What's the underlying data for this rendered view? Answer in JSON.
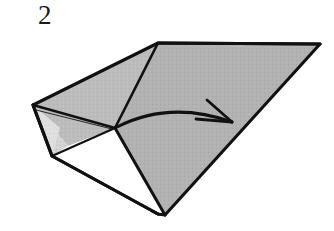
{
  "figure": {
    "kind": "origami-folding-diagram",
    "step_number": "2",
    "background_color": "#ffffff",
    "line_color": "#111111",
    "fill_main": "#b2b2b2",
    "fill_mid": "#bdbdbd",
    "fill_light": "#d2d2d2",
    "fill_paler": "#dcdcdc",
    "fill_white": "#ffffff",
    "arrow": {
      "name": "fold-direction-arrow",
      "color": "#111111",
      "start": [
        117,
        127
      ],
      "end": [
        232,
        122
      ],
      "style": "curved-arc-with-open-v-head"
    },
    "vertices": {
      "left_point": [
        33,
        105
      ],
      "top_apex": [
        158,
        43
      ],
      "right_tip": [
        320,
        44
      ],
      "bottom_point": [
        165,
        215
      ],
      "center_fold": [
        115,
        128
      ],
      "left_lower": [
        52,
        156
      ],
      "left_inner": [
        68,
        146
      ],
      "bottom_left_edge": [
        152,
        211
      ],
      "bottom_notch": [
        158,
        214
      ]
    }
  }
}
